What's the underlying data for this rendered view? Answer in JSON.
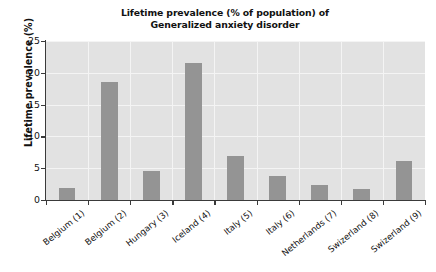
{
  "chart_data": {
    "type": "bar",
    "title": "Lifetime prevalence (% of population) of Generalized anxiety disorder",
    "title_lines": [
      "Lifetime prevalence (% of population) of",
      "Generalized anxiety disorder"
    ],
    "xlabel": "",
    "ylabel": "Lifetime prevalence (%)",
    "categories": [
      "Belgium (1)",
      "Belgium (2)",
      "Hungary (3)",
      "Iceland (4)",
      "Italy (5)",
      "Italy (6)",
      "Netherlands (7)",
      "Swizerland (8)",
      "Swizerland (9)"
    ],
    "values": [
      1.9,
      18.6,
      4.6,
      21.5,
      6.9,
      3.8,
      2.3,
      1.8,
      6.2
    ],
    "ylim": [
      0,
      25
    ],
    "yticks": [
      0,
      5,
      10,
      15,
      20,
      25
    ],
    "ytick_labels": [
      "0",
      "5",
      "10",
      "15",
      "20",
      "25"
    ],
    "grid": true,
    "legend": false,
    "legend_position": "none",
    "bar_color": "#949494",
    "plot_background": "#e2e2e2",
    "gridline_color": "#f4f4f4",
    "axis_color": "#3a3a3a",
    "page_background": "#ffffff"
  }
}
